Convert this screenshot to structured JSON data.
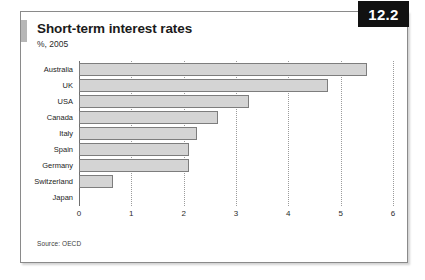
{
  "figure": {
    "badge": "12.2",
    "title": "Short-term interest rates",
    "subtitle": "%, 2005",
    "source": "Source: OECD",
    "accent_color": "#b6b6b6",
    "badge_bg": "#111111",
    "badge_fg": "#ffffff",
    "bar_fill": "#d4d4d4",
    "bar_stroke": "#7d7d7d",
    "grid_color": "#9b9b9b",
    "frame_color": "#8a8a8a"
  },
  "chart_data": {
    "type": "bar",
    "orientation": "horizontal",
    "title": "Short-term interest rates",
    "subtitle": "%, 2005",
    "xlabel": "",
    "ylabel": "",
    "xlim": [
      0,
      6
    ],
    "xticks": [
      0,
      1,
      2,
      3,
      4,
      5,
      6
    ],
    "xtick_labels": [
      "0",
      "1",
      "2",
      "3",
      "4",
      "5",
      "6"
    ],
    "grid": "vertical-dotted",
    "legend": "none",
    "source": "Source: OECD",
    "categories": [
      "Australia",
      "UK",
      "USA",
      "Canada",
      "Italy",
      "Spain",
      "Germany",
      "Switzerland",
      "Japan"
    ],
    "values": [
      5.5,
      4.75,
      3.25,
      2.65,
      2.25,
      2.1,
      2.1,
      0.65,
      0.0
    ]
  }
}
